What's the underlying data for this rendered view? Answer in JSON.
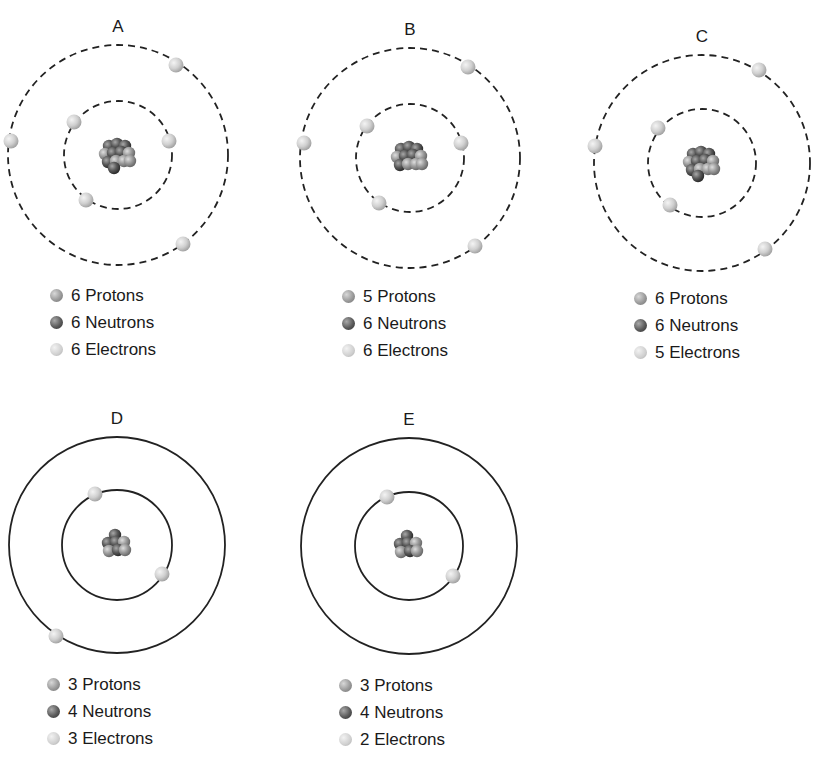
{
  "atoms": [
    {
      "label": "A",
      "orbit_style": "dashed",
      "center": [
        118,
        155
      ],
      "inner_radius": 54,
      "outer_radius": 110,
      "electrons": [
        [
          74,
          122
        ],
        [
          169,
          141
        ],
        [
          86,
          200
        ],
        [
          176,
          65
        ],
        [
          11,
          141
        ],
        [
          183,
          244
        ]
      ],
      "legend": {
        "protons": "6 Protons",
        "neutrons": "6 Neutrons",
        "electrons": "6 Electrons"
      },
      "legend_pos": [
        50,
        282
      ]
    },
    {
      "label": "B",
      "orbit_style": "dashed",
      "center": [
        410,
        158
      ],
      "inner_radius": 54,
      "outer_radius": 110,
      "electrons": [
        [
          367,
          126
        ],
        [
          461,
          143
        ],
        [
          379,
          203
        ],
        [
          468,
          67
        ],
        [
          304,
          143
        ],
        [
          475,
          246
        ]
      ],
      "legend": {
        "protons": "5 Protons",
        "neutrons": "6 Neutrons",
        "electrons": "6 Electrons"
      },
      "legend_pos": [
        342,
        283
      ]
    },
    {
      "label": "C",
      "orbit_style": "dashed",
      "center": [
        702,
        163
      ],
      "inner_radius": 54,
      "outer_radius": 108,
      "electrons": [
        [
          658,
          128
        ],
        [
          670,
          205
        ],
        [
          759,
          70
        ],
        [
          595,
          146
        ],
        [
          765,
          249
        ]
      ],
      "legend": {
        "protons": "6 Protons",
        "neutrons": "6 Neutrons",
        "electrons": "5 Electrons"
      },
      "legend_pos": [
        634,
        285
      ]
    },
    {
      "label": "D",
      "orbit_style": "solid",
      "center": [
        117,
        545
      ],
      "inner_radius": 55,
      "outer_radius": 108,
      "electrons": [
        [
          95,
          494
        ],
        [
          162,
          574
        ],
        [
          56,
          636
        ]
      ],
      "legend": {
        "protons": "3 Protons",
        "neutrons": "4 Neutrons",
        "electrons": "3 Electrons"
      },
      "legend_pos": [
        47,
        671
      ]
    },
    {
      "label": "E",
      "orbit_style": "solid",
      "center": [
        409,
        546
      ],
      "inner_radius": 54,
      "outer_radius": 108,
      "electrons": [
        [
          387,
          497
        ],
        [
          453,
          576
        ]
      ],
      "legend": {
        "protons": "3 Protons",
        "neutrons": "4 Neutrons",
        "electrons": "2 Electrons"
      },
      "legend_pos": [
        339,
        672
      ]
    }
  ],
  "colors": {
    "orbit": "#222222",
    "proton": "#9a9a9a",
    "neutron": "#5a5a5a",
    "electron": "#cfcfcf",
    "text": "#1a1a1a"
  }
}
